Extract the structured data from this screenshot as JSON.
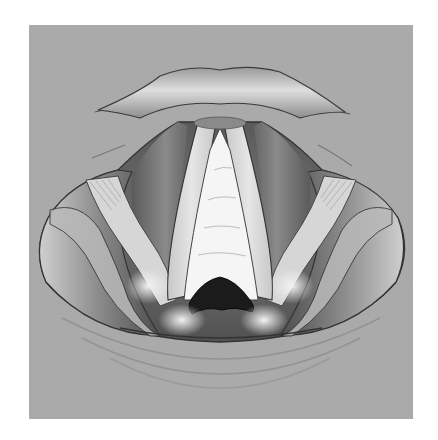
{
  "figure": {
    "alt": "Grayscale anatomical illustration of the larynx showing the epiglottis, vocal folds, vestibular folds and glottis opening",
    "style": "grayscale medical illustration",
    "colors": {
      "page_background": "#ffffff",
      "panel_background": "#a9a9a9",
      "outline": "#3a3a3a",
      "vocal_fold_white": "#f4f4f4",
      "fold_light": "#d0d0d0",
      "shadow_dark": "#5a5a5a",
      "glottis_black": "#1a1a1a"
    },
    "regions": [
      {
        "id": "epiglottis",
        "label": "epiglottis"
      },
      {
        "id": "vocal-folds",
        "label": "vocal folds"
      },
      {
        "id": "vestibular-folds",
        "label": "vestibular folds"
      },
      {
        "id": "glottis",
        "label": "glottis"
      },
      {
        "id": "aryepiglottic-folds",
        "label": "aryepiglottic folds"
      },
      {
        "id": "piriform-sinus",
        "label": "piriform sinus"
      }
    ]
  }
}
